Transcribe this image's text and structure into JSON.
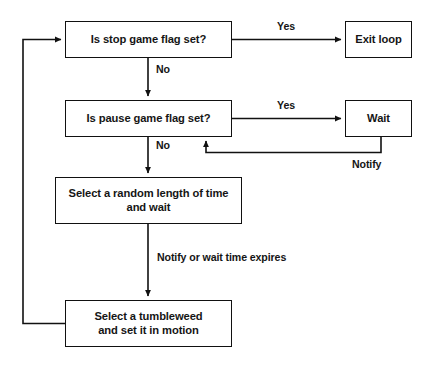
{
  "diagram": {
    "stroke_color": "#111111",
    "background_color": "#ffffff",
    "text_color": "#151515",
    "nodes": [
      {
        "id": "stop-flag",
        "label": "Is stop game flag set?",
        "shape": "rectangle",
        "x": 65,
        "y": 21,
        "w": 167,
        "h": 37
      },
      {
        "id": "exit-loop",
        "label": "Exit loop",
        "shape": "rectangle",
        "x": 345,
        "y": 21,
        "w": 67,
        "h": 37
      },
      {
        "id": "pause-flag",
        "label": "Is pause game flag set?",
        "shape": "rectangle",
        "x": 65,
        "y": 100,
        "w": 167,
        "h": 37
      },
      {
        "id": "wait",
        "label": "Wait",
        "shape": "rectangle",
        "x": 345,
        "y": 100,
        "w": 67,
        "h": 37
      },
      {
        "id": "random-wait",
        "label": "Select a random length of time\nand wait",
        "shape": "rectangle",
        "x": 55,
        "y": 177,
        "w": 187,
        "h": 47
      },
      {
        "id": "tumbleweed",
        "label": "Select a tumbleweed\nand set it in motion",
        "shape": "rectangle",
        "x": 65,
        "y": 300,
        "w": 167,
        "h": 47
      }
    ],
    "edges": [
      {
        "id": "stop-yes",
        "from": "stop-flag",
        "to": "exit-loop",
        "label": "Yes"
      },
      {
        "id": "stop-no",
        "from": "stop-flag",
        "to": "pause-flag",
        "label": "No"
      },
      {
        "id": "pause-yes",
        "from": "pause-flag",
        "to": "wait",
        "label": "Yes"
      },
      {
        "id": "pause-no",
        "from": "pause-flag",
        "to": "random-wait",
        "label": "No"
      },
      {
        "id": "wait-notify",
        "from": "wait",
        "to": "pause-flag",
        "label": "Notify"
      },
      {
        "id": "random-expires",
        "from": "random-wait",
        "to": "tumbleweed",
        "label": "Notify or wait time expires"
      },
      {
        "id": "loop-back",
        "from": "tumbleweed",
        "to": "stop-flag",
        "label": ""
      }
    ],
    "labels": {
      "stop_yes": "Yes",
      "stop_no": "No",
      "pause_yes": "Yes",
      "pause_no": "No",
      "notify": "Notify",
      "notify_or_expires": "Notify or wait time expires"
    }
  }
}
